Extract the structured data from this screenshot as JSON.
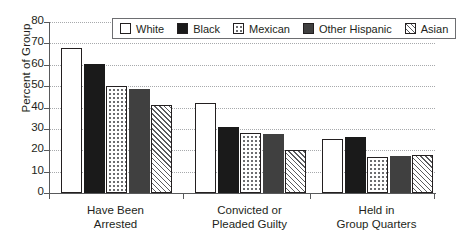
{
  "chart_data": {
    "type": "bar",
    "title": "",
    "xlabel": "",
    "ylabel": "Percent of Group",
    "ylim": [
      0,
      80
    ],
    "yticks": [
      0,
      10,
      20,
      30,
      40,
      50,
      60,
      70,
      80
    ],
    "grid": true,
    "legend_position": "top-center",
    "categories": [
      "Have Been\nArrested",
      "Convicted or\nPleaded Guilty",
      "Held in\nGroup Quarters"
    ],
    "category_lines": [
      [
        "Have Been",
        "Arrested"
      ],
      [
        "Convicted or",
        "Pleaded Guilty"
      ],
      [
        "Held in",
        "Group Quarters"
      ]
    ],
    "series": [
      {
        "name": "White",
        "pattern": "open",
        "color": "#ffffff",
        "values": [
          68.0,
          42.0,
          25.5
        ]
      },
      {
        "name": "Black",
        "pattern": "solid-black",
        "color": "#1a1a1a",
        "values": [
          60.5,
          31.0,
          26.0
        ]
      },
      {
        "name": "Mexican",
        "pattern": "dotted",
        "color": "#ffffff",
        "values": [
          50.0,
          28.0,
          17.0
        ]
      },
      {
        "name": "Other Hispanic",
        "pattern": "solid-gray",
        "color": "#404040",
        "values": [
          48.5,
          27.5,
          17.2
        ]
      },
      {
        "name": "Asian",
        "pattern": "hatched",
        "color": "#ffffff",
        "values": [
          41.0,
          20.0,
          18.0
        ]
      }
    ]
  },
  "legend": {
    "items": [
      {
        "label": "White"
      },
      {
        "label": "Black"
      },
      {
        "label": "Mexican"
      },
      {
        "label": "Other Hispanic"
      },
      {
        "label": "Asian"
      }
    ]
  }
}
